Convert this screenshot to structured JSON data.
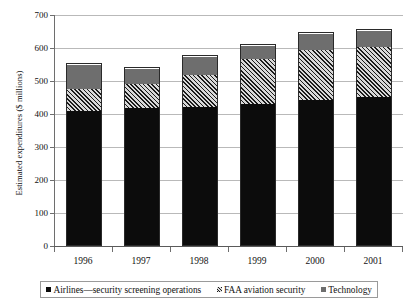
{
  "chart_data": {
    "type": "bar",
    "stacked": true,
    "title": "",
    "xlabel": "",
    "ylabel": "Estimated expenditures ($ millions)",
    "categories": [
      "1996",
      "1997",
      "1998",
      "1999",
      "2000",
      "2001"
    ],
    "ylim": [
      0,
      700
    ],
    "yticks": [
      0,
      100,
      200,
      300,
      400,
      500,
      600,
      700
    ],
    "ytick_labels": [
      "0",
      "100",
      "200",
      "300",
      "400",
      "500",
      "600",
      "700"
    ],
    "grid": true,
    "legend_position": "bottom",
    "series": [
      {
        "name": "Airlines—security screening operations",
        "color": "#0c0c0c",
        "pattern": "solid",
        "values": [
          408,
          418,
          420,
          430,
          443,
          452
        ]
      },
      {
        "name": "FAA aviation security",
        "color": "#8e8e8e",
        "pattern": "diagonal-hatch",
        "values": [
          68,
          73,
          98,
          136,
          151,
          151
        ]
      },
      {
        "name": "Technology",
        "color": "#6e6e6e",
        "pattern": "solid",
        "values": [
          72,
          45,
          54,
          40,
          49,
          50
        ]
      }
    ],
    "cumulative_tops": [
      [
        408,
        476,
        548
      ],
      [
        418,
        491,
        536
      ],
      [
        420,
        518,
        572
      ],
      [
        430,
        566,
        606
      ],
      [
        443,
        594,
        643
      ],
      [
        452,
        603,
        653
      ]
    ],
    "totals": [
      548,
      536,
      572,
      606,
      643,
      653
    ]
  },
  "legend": {
    "items": [
      {
        "label": "Airlines—security screening operations",
        "swatch": "sw-airlines"
      },
      {
        "label": "FAA aviation security",
        "swatch": "sw-faa"
      },
      {
        "label": "Technology",
        "swatch": "sw-tech"
      }
    ]
  }
}
